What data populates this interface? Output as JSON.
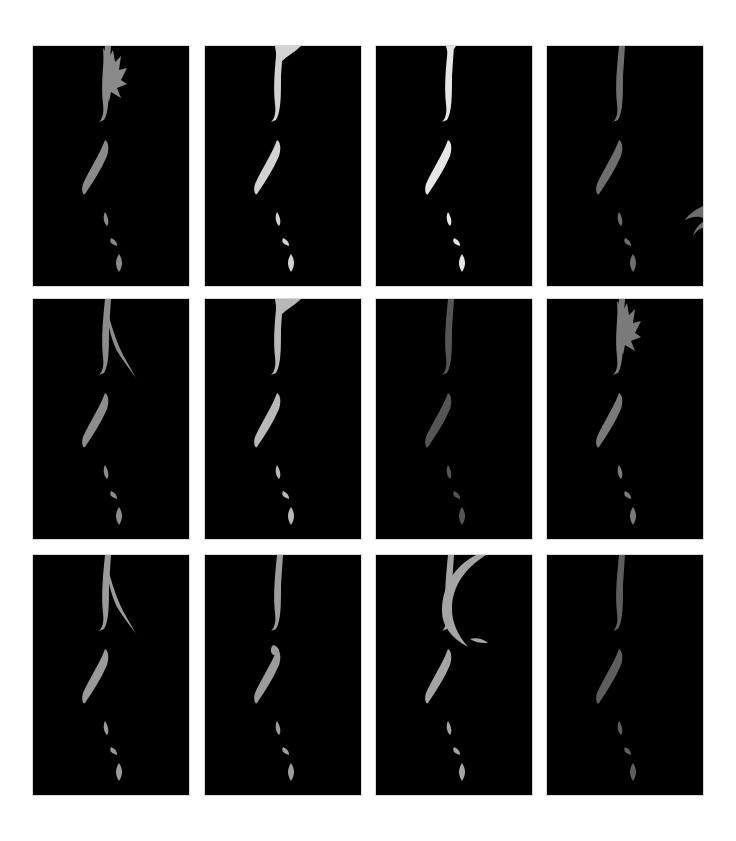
{
  "figure": {
    "layout": {
      "rows": 3,
      "cols": 4
    },
    "panels": [
      {
        "row": 1,
        "col": 1,
        "tone": "#8a8a8a",
        "variant": "spiky-hair",
        "alt": "Rim-lit profile silhouette 1"
      },
      {
        "row": 1,
        "col": 2,
        "tone": "#d2d2d2",
        "variant": "smooth-hair",
        "alt": "Rim-lit profile silhouette 2"
      },
      {
        "row": 1,
        "col": 3,
        "tone": "#e6e6e6",
        "variant": "broken-edge",
        "alt": "Rim-lit profile silhouette 3"
      },
      {
        "row": 1,
        "col": 4,
        "tone": "#6e6e6e",
        "variant": "wisps-right",
        "alt": "Rim-lit profile silhouette 4"
      },
      {
        "row": 2,
        "col": 1,
        "tone": "#8c8c8c",
        "variant": "long-strand",
        "alt": "Rim-lit profile silhouette 5"
      },
      {
        "row": 2,
        "col": 2,
        "tone": "#b8b8b8",
        "variant": "smooth-hair",
        "alt": "Rim-lit profile silhouette 6"
      },
      {
        "row": 2,
        "col": 3,
        "tone": "#555555",
        "variant": "dim-profile",
        "alt": "Rim-lit profile silhouette 7"
      },
      {
        "row": 2,
        "col": 4,
        "tone": "#7a7a7a",
        "variant": "spiky-hair",
        "alt": "Rim-lit profile silhouette 8"
      },
      {
        "row": 3,
        "col": 1,
        "tone": "#9a9a9a",
        "variant": "long-strand",
        "alt": "Rim-lit profile silhouette 9"
      },
      {
        "row": 3,
        "col": 2,
        "tone": "#9c9c9c",
        "variant": "hand-near-face",
        "alt": "Rim-lit profile silhouette 10"
      },
      {
        "row": 3,
        "col": 3,
        "tone": "#a4a4a4",
        "variant": "swept-hair",
        "alt": "Rim-lit profile silhouette 11"
      },
      {
        "row": 3,
        "col": 4,
        "tone": "#5e5e5e",
        "variant": "dim-profile",
        "alt": "Rim-lit profile silhouette 12"
      }
    ]
  }
}
